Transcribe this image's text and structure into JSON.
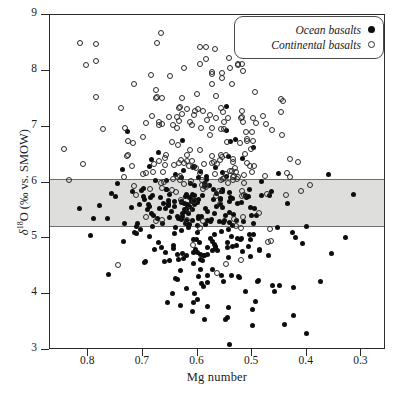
{
  "chart_data": {
    "type": "scatter",
    "title": "",
    "xlabel": "Mg number",
    "ylabel": "δ¹⁸O (‰ vs. SMOW)",
    "xlim": [
      0.87,
      0.255
    ],
    "ylim": [
      3,
      9
    ],
    "x_inverted": true,
    "grid": false,
    "xticks": [
      0.8,
      0.7,
      0.6,
      0.5,
      0.4,
      0.3
    ],
    "xtick_labels": [
      "0.8",
      "0.7",
      "0.6",
      "0.5",
      "0.4",
      "0.3"
    ],
    "yticks": [
      3,
      4,
      5,
      6,
      7,
      8,
      9
    ],
    "ytick_labels": [
      "3",
      "4",
      "5",
      "6",
      "7",
      "8",
      "9"
    ],
    "legend_position": "top-right",
    "annotations": [
      {
        "name": "mantle-range-band",
        "type": "horizontal-band",
        "y_min": 5.2,
        "y_max": 6.07,
        "color": "#dededc"
      }
    ],
    "series": [
      {
        "name": "Ocean basalts",
        "marker": "filled-circle",
        "color": "#0d0d0d",
        "n": 262,
        "x_center": 0.595,
        "x_spread": 0.072,
        "y_center": 5.55,
        "y_spread": 0.62,
        "y_low_tail": 3.5
      },
      {
        "name": "Continental basalts",
        "marker": "open-circle",
        "color": "#2a2a2a",
        "n": 196,
        "x_center": 0.59,
        "x_spread": 0.078,
        "y_center": 6.25,
        "y_spread": 0.66,
        "y_high_tail": 8.6
      }
    ]
  },
  "legend": {
    "items": [
      {
        "label": "Ocean basalts",
        "marker": "filled"
      },
      {
        "label": "Continental basalts",
        "marker": "open"
      }
    ]
  }
}
